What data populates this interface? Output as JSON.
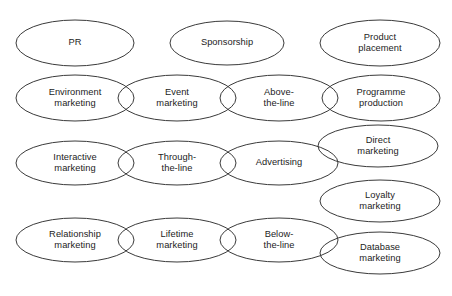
{
  "diagram": {
    "canvas": {
      "width": 452,
      "height": 296,
      "background": "#ffffff"
    },
    "style": {
      "stroke": "#3a3a3a",
      "stroke_width": 1,
      "fill": "none",
      "text_color": "#1c1c1c"
    },
    "nodes": [
      {
        "id": "pr",
        "label": "PR",
        "cx": 75,
        "cy": 43,
        "rx": 59,
        "ry": 23,
        "row": 1
      },
      {
        "id": "sponsorship",
        "label": "Sponsorship",
        "cx": 227,
        "cy": 43,
        "rx": 57,
        "ry": 22,
        "row": 1
      },
      {
        "id": "product-placement",
        "label": "Product\nplacement",
        "cx": 380,
        "cy": 43,
        "rx": 60,
        "ry": 23,
        "row": 1
      },
      {
        "id": "environment-marketing",
        "label": "Environment\nmarketing",
        "cx": 75,
        "cy": 98,
        "rx": 59,
        "ry": 23,
        "row": 2
      },
      {
        "id": "event-marketing",
        "label": "Event\nmarketing",
        "cx": 177,
        "cy": 98,
        "rx": 59,
        "ry": 23,
        "row": 2
      },
      {
        "id": "above-the-line",
        "label": "Above-\nthe-line",
        "cx": 279,
        "cy": 98,
        "rx": 59,
        "ry": 23,
        "row": 2
      },
      {
        "id": "programme-production",
        "label": "Programme\nproduction",
        "cx": 381,
        "cy": 98,
        "rx": 59,
        "ry": 23,
        "row": 2
      },
      {
        "id": "interactive-marketing",
        "label": "Interactive\nmarketing",
        "cx": 75,
        "cy": 163,
        "rx": 59,
        "ry": 22,
        "row": 3
      },
      {
        "id": "through-the-line",
        "label": "Through-\nthe-line",
        "cx": 177,
        "cy": 163,
        "rx": 59,
        "ry": 22,
        "row": 3
      },
      {
        "id": "advertising",
        "label": "Advertising",
        "cx": 279,
        "cy": 163,
        "rx": 59,
        "ry": 22,
        "row": 3
      },
      {
        "id": "direct-marketing",
        "label": "Direct\nmarketing",
        "cx": 378,
        "cy": 146,
        "rx": 60,
        "ry": 21,
        "row": 3
      },
      {
        "id": "loyalty-marketing",
        "label": "Loyalty\nmarketing",
        "cx": 380,
        "cy": 201,
        "rx": 60,
        "ry": 21,
        "row": 3
      },
      {
        "id": "relationship-marketing",
        "label": "Relationship\nmarketing",
        "cx": 75,
        "cy": 240,
        "rx": 59,
        "ry": 22,
        "row": 4
      },
      {
        "id": "lifetime-marketing",
        "label": "Lifetime\nmarketing",
        "cx": 177,
        "cy": 240,
        "rx": 59,
        "ry": 22,
        "row": 4
      },
      {
        "id": "below-the-line",
        "label": "Below-\nthe-line",
        "cx": 279,
        "cy": 240,
        "rx": 59,
        "ry": 22,
        "row": 4
      },
      {
        "id": "database-marketing",
        "label": "Database\nmarketing",
        "cx": 380,
        "cy": 253,
        "rx": 60,
        "ry": 21,
        "row": 4
      }
    ]
  }
}
